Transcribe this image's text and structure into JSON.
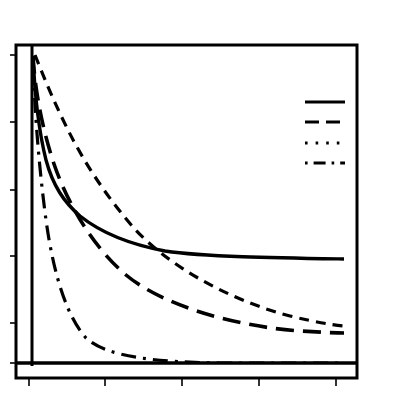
{
  "figure": {
    "title": "",
    "background_color": "#ffffff",
    "ink_color": "#000000",
    "width": 393,
    "height": 399
  },
  "axes": {
    "outer_frame": {
      "x0": 16,
      "y0": 45,
      "x1": 357,
      "y1": 378
    },
    "inner_plot": {
      "x0": 32,
      "y0": 45,
      "x1": 357,
      "y1": 363
    },
    "x_tick_positions_px": [
      29,
      105,
      182,
      259,
      336
    ],
    "y_tick_positions_px": [
      55,
      122,
      190,
      256,
      323,
      363
    ],
    "x_tick_labels": [
      "",
      "",
      "",
      "",
      ""
    ],
    "y_tick_labels": [
      "",
      "",
      "",
      "",
      "",
      ""
    ],
    "xlabel": "",
    "ylabel": "",
    "grid": false
  },
  "legend": {
    "position": "upper-right",
    "box_x": 305,
    "box_y": 95,
    "entries": [
      {
        "label": "",
        "style": "solid",
        "sample_y": 102,
        "dasharray": "",
        "width": 3.2
      },
      {
        "label": "",
        "style": "long-dash",
        "sample_y": 122,
        "dasharray": "14 7",
        "width": 3.2
      },
      {
        "label": "",
        "style": "dotted",
        "sample_y": 143,
        "dasharray": "2.6 8",
        "width": 3.2
      },
      {
        "label": "",
        "style": "dash-dot",
        "sample_y": 163,
        "dasharray": "2.6 6 12 6",
        "width": 3.2
      }
    ]
  },
  "chart_data": {
    "type": "line",
    "title": "",
    "subtitle": "",
    "xlabel": "",
    "ylabel": "",
    "xlim": [
      0,
      100
    ],
    "ylim": [
      0,
      100
    ],
    "grid": false,
    "legend_position": "upper right",
    "x": [
      0,
      1,
      2,
      3,
      4,
      5,
      7,
      10,
      13,
      17,
      21,
      26,
      32,
      40,
      50,
      62,
      75,
      88,
      100
    ],
    "series": [
      {
        "name": "series-1",
        "style": "solid",
        "dasharray": "",
        "values": [
          100,
          92,
          83,
          76,
          71,
          67,
          61,
          55,
          51,
          47,
          44,
          41,
          39,
          36,
          34,
          32,
          30,
          29,
          28
        ]
      },
      {
        "name": "series-2",
        "style": "short-dash",
        "dasharray": "10 7",
        "values": [
          100,
          97,
          93,
          89,
          85,
          82,
          76,
          69,
          63,
          57,
          52,
          47,
          42,
          37,
          32,
          27,
          24,
          21,
          19
        ]
      },
      {
        "name": "series-3",
        "style": "long-dash",
        "dasharray": "18 9",
        "values": [
          100,
          83,
          71,
          63,
          57,
          52,
          45,
          38,
          34,
          30,
          27,
          25,
          23,
          21,
          19,
          18,
          17,
          16,
          16
        ]
      },
      {
        "name": "series-4",
        "style": "dash-dot",
        "dasharray": "3 7 15 7",
        "values": [
          100,
          61,
          43,
          33,
          27,
          22,
          17,
          12,
          9,
          7,
          6,
          5,
          4,
          3,
          2,
          2,
          1,
          1,
          1
        ]
      }
    ]
  },
  "curve_paths_px": {
    "solid": "M 33,56 C 35,100 39,132 46,160 C 53,186 64,202 80,216 C 100,232 128,244 165,251 C 205,257 280,258 344,259",
    "short_dash": "M 35,55 C 44,78 55,104 68,130 C 84,162 106,196 133,227 C 165,263 225,299 290,316 C 315,322 332,325 345,326",
    "long_dash": "M 33,56 C 35,90 42,128 54,164 C 68,205 94,248 126,275 C 166,308 242,327 300,331 C 320,332 334,333 344,333",
    "dash_dot": "M 33,56 C 34,100 38,160 46,220 C 54,278 68,318 86,338 C 108,358 160,362 220,363 C 280,363 320,363 345,363"
  }
}
